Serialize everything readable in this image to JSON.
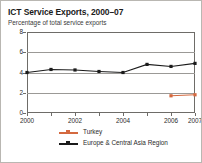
{
  "chart_data": {
    "type": "line",
    "title": "ICT Service Exports, 2000–07",
    "subtitle": "Percentage of total service exports",
    "xlabel": "",
    "ylabel": "",
    "x": [
      2000,
      2001,
      2002,
      2003,
      2004,
      2005,
      2006,
      2007
    ],
    "xtick_labels": [
      "2000",
      "",
      "2002",
      "",
      "2004",
      "",
      "2006",
      "2007"
    ],
    "ytick_labels": [
      "0",
      "2",
      "4",
      "6",
      "8"
    ],
    "yticks": [
      0,
      2,
      4,
      6,
      8
    ],
    "ylim": [
      0,
      8
    ],
    "xlim": [
      2000,
      2007
    ],
    "grid": true,
    "grid_axis": "y",
    "legend_position": "bottom",
    "series": [
      {
        "name": "Turkey",
        "color": "#d4693f",
        "marker": "square",
        "x": [
          2006,
          2007
        ],
        "values": [
          1.7,
          1.8
        ]
      },
      {
        "name": "Europe & Central Asia Region",
        "color": "#1b1b1b",
        "marker": "square",
        "x": [
          2000,
          2001,
          2002,
          2003,
          2004,
          2005,
          2006,
          2007
        ],
        "values": [
          4.0,
          4.3,
          4.25,
          4.1,
          4.0,
          4.8,
          4.6,
          4.9
        ]
      }
    ]
  },
  "figure": {
    "border_color": "#b9b7b2",
    "background": "#ffffff",
    "axis_color": "#6e6c68",
    "grid_color": "#9b9996"
  },
  "legend": {
    "items": [
      {
        "label": "Turkey",
        "color": "#d4693f"
      },
      {
        "label": "Europe & Central Asia Region",
        "color": "#1b1b1b"
      }
    ]
  }
}
